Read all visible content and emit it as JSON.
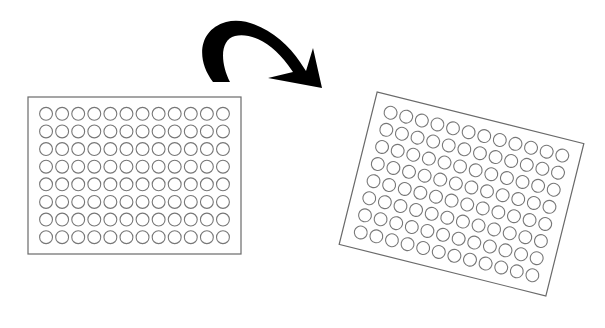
{
  "diagram": {
    "plates": [
      {
        "id": "plate-original",
        "rows": 8,
        "cols": 12,
        "x": 28,
        "y": 97,
        "width": 213,
        "height": 157,
        "rotation_deg": 0
      },
      {
        "id": "plate-rotated",
        "rows": 8,
        "cols": 12,
        "cx": 461.5,
        "cy": 194,
        "width": 213,
        "height": 157,
        "rotation_deg": 14
      }
    ],
    "arrow": {
      "type": "curved-rotation-arrow",
      "color": "#000000"
    },
    "colors": {
      "plate_border": "#6a6a6a",
      "well_stroke": "#777777",
      "background": "#ffffff"
    }
  }
}
